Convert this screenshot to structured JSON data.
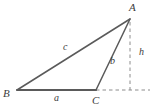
{
  "figure": {
    "kind": "geometry-diagram",
    "background_color": "#ffffff",
    "stroke_color": "#5a5a5a",
    "dashed_color": "#8c8c8c",
    "label_color": "#3c3c3c",
    "canvas": {
      "width": 155,
      "height": 111
    }
  },
  "vertices": [
    {
      "id": "A",
      "label": "A",
      "x": 130,
      "y": 19
    },
    {
      "id": "B",
      "label": "B",
      "x": 17,
      "y": 90
    },
    {
      "id": "C",
      "label": "C",
      "x": 96,
      "y": 90
    }
  ],
  "sides": [
    {
      "id": "a",
      "label": "a",
      "from": "B",
      "to": "C",
      "note": "base side opposite A"
    },
    {
      "id": "b",
      "label": "b",
      "from": "C",
      "to": "A",
      "note": "side opposite B"
    },
    {
      "id": "c",
      "label": "c",
      "from": "B",
      "to": "A",
      "note": "side opposite C"
    }
  ],
  "altitude": {
    "id": "h",
    "label": "h",
    "from": "A",
    "foot_x": 130,
    "foot_y": 90,
    "style": "dashed",
    "note": "perpendicular height from A to the extension of BC"
  },
  "extension_line": {
    "label": "",
    "from_x": 96,
    "from_y": 90,
    "to_x": 150,
    "to_y": 90,
    "style": "dashed",
    "note": "extension of base BC beyond C"
  },
  "labels": {
    "A": "A",
    "B": "B",
    "C": "C",
    "a": "a",
    "b": "b",
    "c": "c",
    "h": "h"
  }
}
